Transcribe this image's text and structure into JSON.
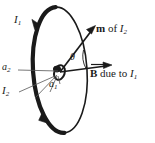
{
  "figure": {
    "labels": {
      "current_outer": "I",
      "current_outer_sub": "1",
      "current_inner": "I",
      "current_inner_sub": "2",
      "radius_outer": "a",
      "radius_outer_sub": "2",
      "radius_inner": "a",
      "radius_inner_sub": "1",
      "angle": "θ",
      "moment_prefix": "m",
      "moment_text": " of ",
      "moment_symbol": "I",
      "moment_sub": "2",
      "field_prefix": "B",
      "field_text": " due to ",
      "field_symbol": "I",
      "field_sub": "1"
    },
    "colors": {
      "stroke": "#1a1a1a",
      "thin_stroke": "#555555",
      "background": "#ffffff"
    },
    "geometry": {
      "outer_loop_center_x": 60,
      "outer_loop_center_y": 70,
      "outer_loop_rx": 27,
      "outer_loop_ry": 63,
      "outer_loop_rotation_deg": -4,
      "inner_loop_center_x": 59,
      "inner_loop_center_y": 72,
      "angle_theta_deg": 33
    }
  }
}
